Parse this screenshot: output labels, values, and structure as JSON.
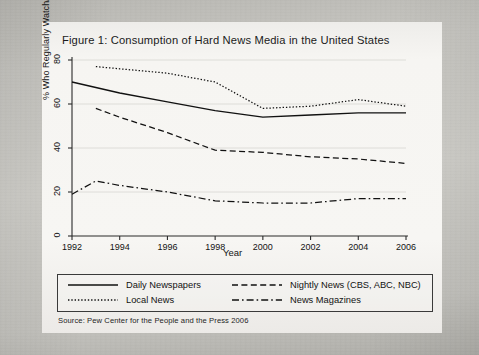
{
  "figure": {
    "title": "Figure 1: Consumption of Hard News Media in the United States",
    "source_note": "Source: Pew Center for the People and the Press 2006"
  },
  "chart_data": {
    "type": "line",
    "title": "Figure 1: Consumption of Hard News Media in the United States",
    "xlabel": "Year",
    "ylabel": "% Who Regularly Watch/Read",
    "xlim": [
      1992,
      2006
    ],
    "ylim": [
      0,
      80
    ],
    "xticks": [
      1992,
      1994,
      1996,
      1998,
      2000,
      2002,
      2004,
      2006
    ],
    "yticks": [
      0,
      20,
      40,
      60,
      80
    ],
    "grid": true,
    "legend_position": "below-plot",
    "series": [
      {
        "name": "Daily Newspapers",
        "style": "solid",
        "x": [
          1992,
          1994,
          1996,
          1998,
          2000,
          2002,
          2004,
          2006
        ],
        "values": [
          70,
          65,
          61,
          57,
          54,
          55,
          56,
          56
        ]
      },
      {
        "name": "Local News",
        "style": "dotted",
        "x": [
          1993,
          1994,
          1996,
          1998,
          2000,
          2002,
          2004,
          2006
        ],
        "values": [
          77,
          76,
          74,
          70,
          58,
          59,
          62,
          59
        ]
      },
      {
        "name": "Nightly News (CBS, ABC, NBC)",
        "style": "dashed",
        "x": [
          1993,
          1994,
          1996,
          1998,
          2000,
          2002,
          2004,
          2006
        ],
        "values": [
          58,
          54,
          47,
          39,
          38,
          36,
          35,
          33
        ]
      },
      {
        "name": "News Magazines",
        "style": "dash-dot",
        "x": [
          1992,
          1993,
          1994,
          1996,
          1998,
          2000,
          2002,
          2004,
          2006
        ],
        "values": [
          19,
          25,
          23,
          20,
          16,
          15,
          15,
          17,
          17
        ]
      }
    ]
  },
  "axis": {
    "ylabel": "% Who Regularly Watch/Read",
    "xlabel": "Year",
    "yticks": [
      "0",
      "20",
      "40",
      "60",
      "80"
    ],
    "xticks": [
      "1992",
      "1994",
      "1996",
      "1998",
      "2000",
      "2002",
      "2004",
      "2006"
    ]
  },
  "legend": {
    "items": [
      {
        "label": "Daily Newspapers",
        "style": "solid"
      },
      {
        "label": "Local News",
        "style": "dotted"
      },
      {
        "label": "Nightly News (CBS, ABC, NBC)",
        "style": "dashed"
      },
      {
        "label": "News Magazines",
        "style": "dash-dot"
      }
    ]
  },
  "colors": {
    "ink": "#111111",
    "paper": "#f5f4f1",
    "scan_background": "#c3c2bd",
    "grid": "#d8d7d2"
  }
}
